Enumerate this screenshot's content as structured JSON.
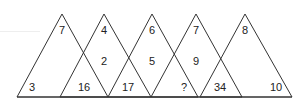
{
  "puzzle": {
    "description": "Five overlapping triangles with numbers in regions; find the missing number",
    "stroke_color": "#333333",
    "background": "#ffffff",
    "triangles": [
      {
        "apex": "7",
        "left": "3",
        "right": "16"
      },
      {
        "apex": "4",
        "left": "16",
        "right": "17",
        "middle": "2"
      },
      {
        "apex": "6",
        "left": "17",
        "right": "?",
        "middle": "5"
      },
      {
        "apex": "7",
        "left": "?",
        "right": "34",
        "middle": "9"
      },
      {
        "apex": "8",
        "left": "34",
        "right": "10"
      }
    ],
    "labels": {
      "t1_apex": "7",
      "t2_apex": "4",
      "t3_apex": "6",
      "t4_apex": "7",
      "t5_apex": "8",
      "mid_1": "2",
      "mid_2": "5",
      "mid_3": "9",
      "bottom_1": "3",
      "bottom_2": "16",
      "bottom_3": "17",
      "bottom_4": "?",
      "bottom_5": "34",
      "bottom_6": "10"
    }
  }
}
